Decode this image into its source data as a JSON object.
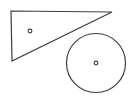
{
  "canvas": {
    "width": 137,
    "height": 101,
    "background_color": "#ffffff",
    "title": "Geometric shapes diagram"
  },
  "style": {
    "stroke_color": "#3c3c44",
    "stroke_width": 1.2,
    "marker_stroke_color": "#3c3c44",
    "marker_stroke_width": 1.1,
    "fill": "none"
  },
  "shapes": [
    {
      "id": "triangle",
      "name": "right-triangle",
      "type": "polygon",
      "points": "11,11 112,12 12,61",
      "vertices": [
        {
          "label": "top-left",
          "x": 11,
          "y": 11
        },
        {
          "label": "top-right",
          "x": 112,
          "y": 12
        },
        {
          "label": "bottom-left",
          "x": 12,
          "y": 61
        }
      ],
      "stroke_color": "#3c3c44",
      "fill": "none",
      "center_marker": {
        "x": 30,
        "y": 31,
        "radius": 1.9
      }
    },
    {
      "id": "circle",
      "name": "circle",
      "type": "circle",
      "center": {
        "x": 96,
        "y": 63
      },
      "radius": 29.5,
      "stroke_color": "#3c3c44",
      "fill": "none",
      "center_marker": {
        "x": 96,
        "y": 63,
        "radius": 1.9
      }
    }
  ]
}
